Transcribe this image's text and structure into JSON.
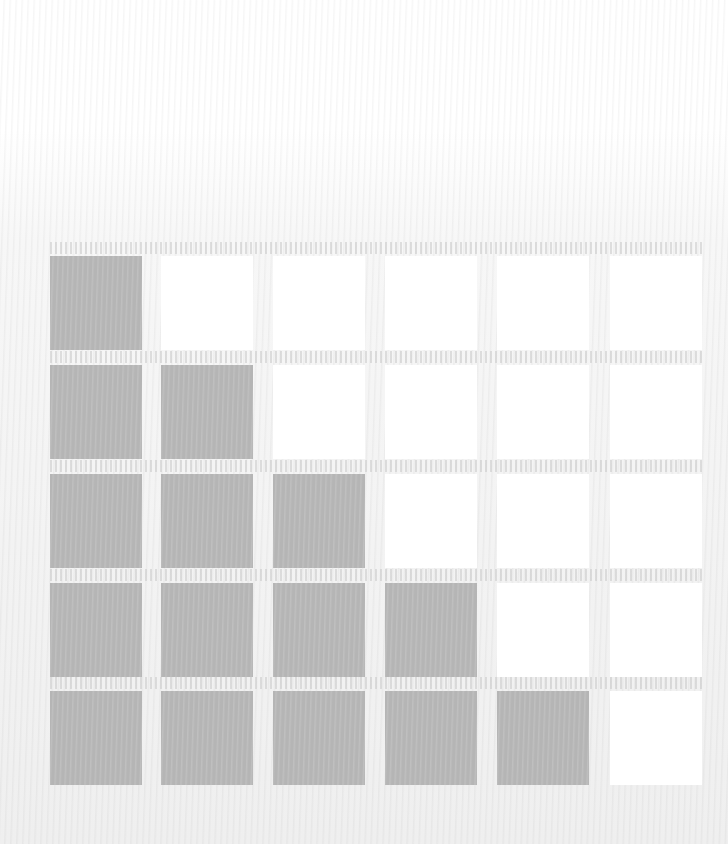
{
  "diagram": {
    "type": "staircase-grid",
    "columns": 6,
    "rows": 5,
    "filled_per_column": [
      5,
      4,
      3,
      2,
      1,
      0
    ],
    "colors": {
      "filled": "#b5b5b5",
      "empty": "#ffffff",
      "background": "#f2f2f2"
    },
    "column_x": [
      50,
      161,
      273,
      385,
      497,
      610
    ],
    "row_y": [
      256,
      365,
      474,
      583,
      691
    ],
    "cell_width": 92,
    "cell_height": 94
  }
}
